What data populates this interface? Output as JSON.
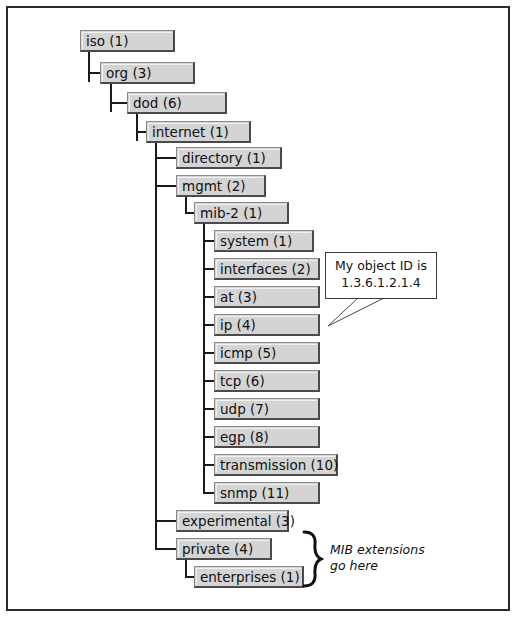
{
  "diagram": {
    "frame_color": "#2a2a2a",
    "node_fill": "#d4d4d4",
    "line_color": "#1a1a1a"
  },
  "nodes": [
    {
      "label": "iso (1)",
      "x": 80,
      "y": 30,
      "w": 95,
      "depth": 0
    },
    {
      "label": "org (3)",
      "x": 100,
      "y": 62,
      "w": 95,
      "depth": 1
    },
    {
      "label": "dod (6)",
      "x": 127,
      "y": 92,
      "w": 100,
      "depth": 2
    },
    {
      "label": "internet (1)",
      "x": 146,
      "y": 121,
      "w": 105,
      "depth": 3
    },
    {
      "label": "directory (1)",
      "x": 176,
      "y": 147,
      "w": 106,
      "depth": 4
    },
    {
      "label": "mgmt (2)",
      "x": 176,
      "y": 175,
      "w": 90,
      "depth": 4
    },
    {
      "label": "mib-2 (1)",
      "x": 194,
      "y": 202,
      "w": 95,
      "depth": 5
    },
    {
      "label": "system (1)",
      "x": 214,
      "y": 230,
      "w": 100,
      "depth": 6
    },
    {
      "label": "interfaces (2)",
      "x": 214,
      "y": 258,
      "w": 106,
      "depth": 6
    },
    {
      "label": "at (3)",
      "x": 214,
      "y": 286,
      "w": 106,
      "depth": 6
    },
    {
      "label": "ip (4)",
      "x": 214,
      "y": 314,
      "w": 106,
      "depth": 6
    },
    {
      "label": "icmp (5)",
      "x": 214,
      "y": 342,
      "w": 106,
      "depth": 6
    },
    {
      "label": "tcp (6)",
      "x": 214,
      "y": 370,
      "w": 106,
      "depth": 6
    },
    {
      "label": "udp (7)",
      "x": 214,
      "y": 398,
      "w": 106,
      "depth": 6
    },
    {
      "label": "egp (8)",
      "x": 214,
      "y": 426,
      "w": 106,
      "depth": 6
    },
    {
      "label": "transmission (10)",
      "x": 214,
      "y": 454,
      "w": 124,
      "depth": 6
    },
    {
      "label": "snmp (11)",
      "x": 214,
      "y": 482,
      "w": 106,
      "depth": 6
    },
    {
      "label": "experimental (3)",
      "x": 176,
      "y": 510,
      "w": 113,
      "depth": 4
    },
    {
      "label": "private (4)",
      "x": 176,
      "y": 538,
      "w": 96,
      "depth": 4
    },
    {
      "label": "enterprises (1)",
      "x": 194,
      "y": 566,
      "w": 110,
      "depth": 5
    }
  ],
  "callout": {
    "line1": "My object ID is",
    "line2": "1.3.6.1.2.1.4",
    "points_to": "ip (4)",
    "x": 325,
    "y": 252,
    "w": 112,
    "h": 47
  },
  "brace_annotation": {
    "line1": "MIB extensions",
    "line2": "go here",
    "covers": [
      "private (4)",
      "enterprises (1)"
    ],
    "x": 300,
    "y": 530,
    "h": 58
  },
  "connectors": {
    "trunks": [
      {
        "name": "iso-trunk",
        "x": 88,
        "y": 52,
        "h": 30
      },
      {
        "name": "org-trunk",
        "x": 110,
        "y": 84,
        "h": 28
      },
      {
        "name": "dod-trunk",
        "x": 136,
        "y": 114,
        "h": 27
      },
      {
        "name": "internet-trunk",
        "x": 155,
        "y": 143,
        "h": 407
      },
      {
        "name": "mgmt-trunk",
        "x": 185,
        "y": 197,
        "h": 17
      },
      {
        "name": "mib2-trunk",
        "x": 203,
        "y": 224,
        "h": 269
      },
      {
        "name": "private-trunk",
        "x": 185,
        "y": 560,
        "h": 18
      }
    ],
    "branches": [
      {
        "name": "to-org",
        "x": 88,
        "y": 72,
        "w": 12
      },
      {
        "name": "to-dod",
        "x": 110,
        "y": 102,
        "w": 17
      },
      {
        "name": "to-internet",
        "x": 136,
        "y": 131,
        "w": 10
      },
      {
        "name": "to-directory",
        "x": 155,
        "y": 157,
        "w": 21
      },
      {
        "name": "to-mgmt",
        "x": 155,
        "y": 185,
        "w": 21
      },
      {
        "name": "to-mib2",
        "x": 185,
        "y": 212,
        "w": 9
      },
      {
        "name": "to-system",
        "x": 203,
        "y": 240,
        "w": 11
      },
      {
        "name": "to-interfaces",
        "x": 203,
        "y": 268,
        "w": 11
      },
      {
        "name": "to-at",
        "x": 203,
        "y": 296,
        "w": 11
      },
      {
        "name": "to-ip",
        "x": 203,
        "y": 324,
        "w": 11
      },
      {
        "name": "to-icmp",
        "x": 203,
        "y": 352,
        "w": 11
      },
      {
        "name": "to-tcp",
        "x": 203,
        "y": 380,
        "w": 11
      },
      {
        "name": "to-udp",
        "x": 203,
        "y": 408,
        "w": 11
      },
      {
        "name": "to-egp",
        "x": 203,
        "y": 436,
        "w": 11
      },
      {
        "name": "to-transmission",
        "x": 203,
        "y": 464,
        "w": 11
      },
      {
        "name": "to-snmp",
        "x": 203,
        "y": 492,
        "w": 11
      },
      {
        "name": "to-experimental",
        "x": 155,
        "y": 520,
        "w": 21
      },
      {
        "name": "to-private",
        "x": 155,
        "y": 548,
        "w": 21
      },
      {
        "name": "to-enterprises",
        "x": 185,
        "y": 576,
        "w": 9
      }
    ]
  }
}
